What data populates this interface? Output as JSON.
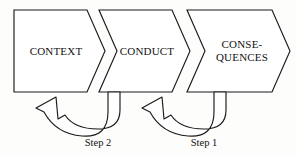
{
  "figure": {
    "background_color": "#fdfdfb",
    "line_color": "#1a1a1a",
    "fill_color": "#ffffff"
  },
  "stages": [
    {
      "id": "context",
      "label": "CONTEXT",
      "label_lines": [
        "CONTEXT"
      ],
      "shape": "rectangle-with-arrow-point",
      "order": 1
    },
    {
      "id": "conduct",
      "label": "CONDUCT",
      "label_lines": [
        "CONDUCT"
      ],
      "shape": "chevron",
      "order": 2
    },
    {
      "id": "consequences",
      "label": "CONSEQUENCES",
      "label_lines": [
        "CONSE-",
        "QUENCES"
      ],
      "shape": "chevron",
      "order": 3
    }
  ],
  "feedback_arrows": [
    {
      "id": "step-2",
      "label": "Step 2",
      "from": "CONDUCT",
      "to": "CONTEXT",
      "direction": "right-to-left",
      "style": "open curved arrow"
    },
    {
      "id": "step-1",
      "label": "Step 1",
      "from": "CONSEQUENCES",
      "to": "CONDUCT",
      "direction": "right-to-left",
      "style": "open curved arrow"
    }
  ]
}
